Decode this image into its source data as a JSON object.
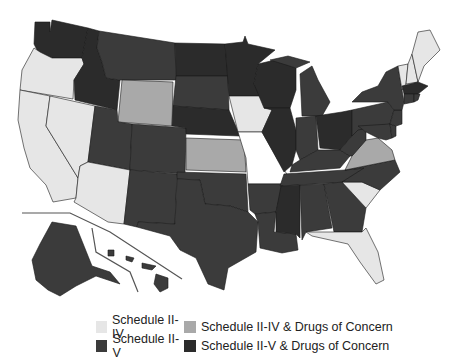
{
  "map": {
    "region": "United States",
    "states": {
      "WA": "Schedule II-V & Drugs of Concern",
      "OR": "Schedule II-IV",
      "CA": "Schedule II-IV",
      "NV": "Schedule II-IV",
      "ID": "Schedule II-V & Drugs of Concern",
      "MT": "Schedule II-V",
      "WY": "Schedule II-IV & Drugs of Concern",
      "UT": "Schedule II-V",
      "AZ": "Schedule II-IV",
      "CO": "Schedule II-V",
      "NM": "Schedule II-V",
      "ND": "Schedule II-V & Drugs of Concern",
      "SD": "Schedule II-V",
      "NE": "Schedule II-V & Drugs of Concern",
      "KS": "Schedule II-IV & Drugs of Concern",
      "OK": "Schedule II-V",
      "TX": "Schedule II-V",
      "MN": "Schedule II-V & Drugs of Concern",
      "IA": "Schedule II-IV",
      "MO": "None",
      "AR": "Schedule II-V",
      "LA": "Schedule II-V",
      "WI": "Schedule II-V & Drugs of Concern",
      "IL": "Schedule II-V & Drugs of Concern",
      "MI": "Schedule II-V",
      "IN": "Schedule II-V",
      "OH": "Schedule II-V & Drugs of Concern",
      "KY": "Schedule II-V",
      "TN": "Schedule II-V",
      "MS": "Schedule II-V & Drugs of Concern",
      "AL": "Schedule II-V",
      "GA": "Schedule II-V",
      "FL": "Schedule II-IV",
      "SC": "Schedule II-IV",
      "NC": "Schedule II-V",
      "VA": "Schedule II-IV & Drugs of Concern",
      "WV": "Schedule II-V",
      "PA": "Schedule II-V",
      "NY": "Schedule II-V",
      "VT": "Schedule II-IV",
      "NH": "Schedule II-IV",
      "ME": "Schedule II-IV",
      "MA": "Schedule II-V & Drugs of Concern",
      "CT": "Schedule II-V",
      "RI": "Schedule II-V",
      "NJ": "Schedule II-V",
      "DE": "Schedule II-V",
      "MD": "Schedule II-V",
      "AK": "Schedule II-V",
      "HI": "Schedule II-V"
    }
  },
  "legend": {
    "items": [
      {
        "label": "Schedule II-IV",
        "color": "#e6e6e6"
      },
      {
        "label": "Schedule II-IV & Drugs of Concern",
        "color": "#a9a9a9"
      },
      {
        "label": "Schedule II-V",
        "color": "#3b3b3b"
      },
      {
        "label": "Schedule II-V & Drugs of Concern",
        "color": "#2b2b2b"
      }
    ]
  }
}
